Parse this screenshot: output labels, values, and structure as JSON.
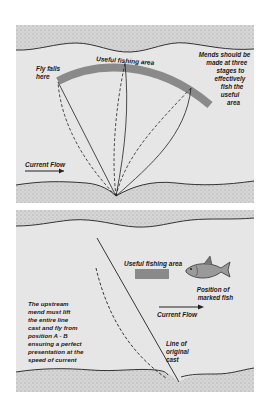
{
  "figure": {
    "top_panel": {
      "labels": {
        "fly_falls": [
          "Fly falls",
          "here"
        ],
        "useful_area": "Useful fishing area",
        "mends_note": [
          "Mends should be",
          "made at three",
          "stages to",
          "effectively",
          "fish the",
          "useful",
          "area"
        ],
        "current_flow": "Current Flow"
      }
    },
    "bottom_panel": {
      "labels": {
        "useful_area": "Useful fishing area",
        "fish_position": [
          "Position of",
          "marked fish"
        ],
        "current_flow": "Current Flow",
        "mend_note": [
          "The upstream",
          "mend must lift",
          "the entire line",
          "cast and fly from",
          "position A - B",
          "ensuring a perfect",
          "presentation at the",
          "speed of current"
        ],
        "line_of_cast": [
          "Line of",
          "original",
          "cast"
        ]
      }
    },
    "colors": {
      "water": "#e6e6e6",
      "bank": "#cfcfcf",
      "useful_area_band": "#8a8a8a",
      "line": "#222222"
    }
  }
}
